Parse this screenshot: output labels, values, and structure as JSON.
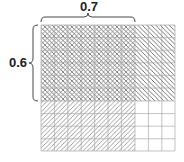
{
  "diagram": {
    "grid": {
      "rows": 10,
      "cols": 10
    },
    "labels": {
      "top": "0.7",
      "left": "0.6"
    },
    "regions": [
      {
        "name": "overlap",
        "cols": 7,
        "rows": 6,
        "pattern": "cross-hatch"
      },
      {
        "name": "top-right",
        "cols": 3,
        "rows": 6,
        "pattern": "diagonal-down"
      },
      {
        "name": "bottom-left",
        "cols": 7,
        "rows": 4,
        "pattern": "diagonal-up"
      },
      {
        "name": "bottom-right",
        "cols": 3,
        "rows": 4,
        "pattern": "none"
      }
    ]
  }
}
